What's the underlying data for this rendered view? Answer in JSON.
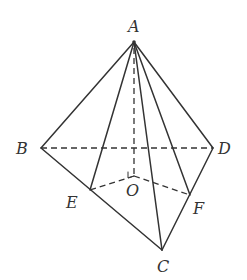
{
  "diagram": {
    "type": "pyramid",
    "vertices": {
      "A": {
        "label": "A",
        "x": 134,
        "y": 42,
        "lx": 128,
        "ly": 32
      },
      "B": {
        "label": "B",
        "x": 41,
        "y": 148,
        "lx": 16,
        "ly": 154
      },
      "C": {
        "label": "C",
        "x": 162,
        "y": 250,
        "lx": 157,
        "ly": 272
      },
      "D": {
        "label": "D",
        "x": 213,
        "y": 148,
        "lx": 218,
        "ly": 154
      },
      "E": {
        "label": "E",
        "x": 90,
        "y": 190,
        "lx": 66,
        "ly": 208
      },
      "F": {
        "label": "F",
        "x": 190,
        "y": 195,
        "lx": 193,
        "ly": 214
      },
      "O": {
        "label": "O",
        "x": 134,
        "y": 176,
        "lx": 126,
        "ly": 196
      }
    },
    "solid_edges": [
      [
        "A",
        "B"
      ],
      [
        "A",
        "D"
      ],
      [
        "A",
        "C"
      ],
      [
        "A",
        "E"
      ],
      [
        "A",
        "F"
      ],
      [
        "B",
        "C"
      ],
      [
        "C",
        "D"
      ]
    ],
    "dashed_edges": [
      [
        "B",
        "D"
      ],
      [
        "A",
        "O"
      ],
      [
        "O",
        "E"
      ],
      [
        "O",
        "F"
      ]
    ],
    "right_angle_at": "O"
  }
}
